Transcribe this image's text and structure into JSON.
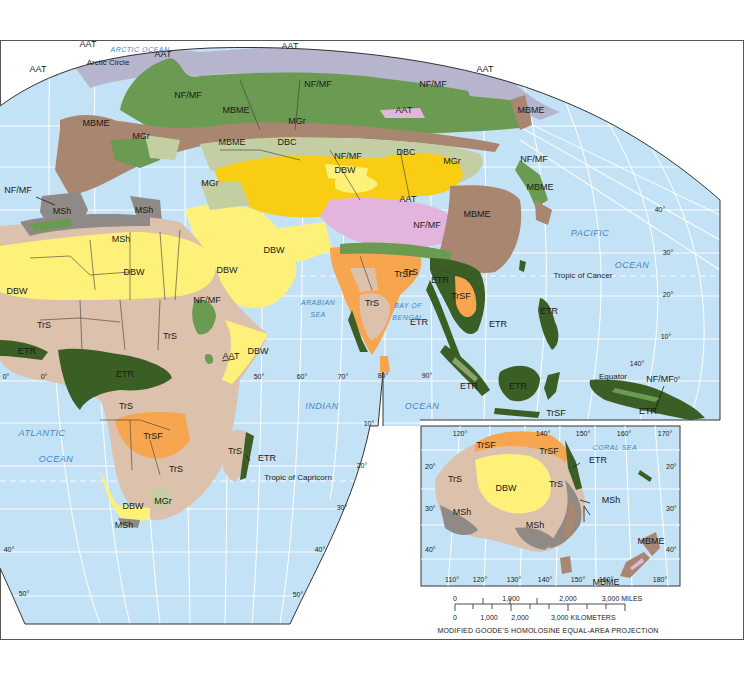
{
  "map": {
    "projection": "MODIFIED GOODE'S HOMOLOSINE EQUAL-AREA PROJECTION",
    "colors": {
      "ocean": "#c4e2f5",
      "land_border": "#3d3d3d",
      "AAT": "#b7b4cd",
      "AAT_highland": "#e3b5dc",
      "NF_MF": "#6b9a52",
      "MBME": "#a88670",
      "MGr": "#c3cfa3",
      "DBC": "#f9cd14",
      "DBW": "#fdf17a",
      "MSh": "#8f8a86",
      "TrS": "#dcc1ad",
      "TrSF": "#f8a54f",
      "ETR": "#3b5e24",
      "graticule": "#ffffff"
    },
    "biome_labels": [
      {
        "code": "AAT",
        "x": 88,
        "y": 47
      },
      {
        "code": "AAT",
        "x": 163,
        "y": 57
      },
      {
        "code": "AAT",
        "x": 38,
        "y": 72
      },
      {
        "code": "AAT",
        "x": 290,
        "y": 49
      },
      {
        "code": "AAT",
        "x": 485,
        "y": 72
      },
      {
        "code": "AAT",
        "x": 404,
        "y": 113
      },
      {
        "code": "AAT",
        "x": 408,
        "y": 202
      },
      {
        "code": "AAT",
        "x": 231,
        "y": 359
      },
      {
        "code": "NF/MF",
        "x": 188,
        "y": 98
      },
      {
        "code": "NF/MF",
        "x": 318,
        "y": 87
      },
      {
        "code": "NF/MF",
        "x": 433,
        "y": 87
      },
      {
        "code": "NF/MF",
        "x": 348,
        "y": 159
      },
      {
        "code": "NF/MF",
        "x": 534,
        "y": 162
      },
      {
        "code": "NF/MF",
        "x": 18,
        "y": 193
      },
      {
        "code": "NF/MF",
        "x": 427,
        "y": 228
      },
      {
        "code": "NF/MF",
        "x": 207,
        "y": 303
      },
      {
        "code": "NF/MF",
        "x": 660,
        "y": 382
      },
      {
        "code": "MBME",
        "x": 236,
        "y": 113
      },
      {
        "code": "MBME",
        "x": 96,
        "y": 126
      },
      {
        "code": "MBME",
        "x": 232,
        "y": 145
      },
      {
        "code": "MBME",
        "x": 531,
        "y": 113
      },
      {
        "code": "MBME",
        "x": 540,
        "y": 190
      },
      {
        "code": "MBME",
        "x": 477,
        "y": 217
      },
      {
        "code": "MBME",
        "x": 606,
        "y": 585
      },
      {
        "code": "MBME",
        "x": 651,
        "y": 544
      },
      {
        "code": "MGr",
        "x": 297,
        "y": 124
      },
      {
        "code": "MGr",
        "x": 141,
        "y": 139
      },
      {
        "code": "MGr",
        "x": 210,
        "y": 186
      },
      {
        "code": "MGr",
        "x": 452,
        "y": 164
      },
      {
        "code": "MGr",
        "x": 163,
        "y": 504
      },
      {
        "code": "DBC",
        "x": 287,
        "y": 145
      },
      {
        "code": "DBC",
        "x": 406,
        "y": 155
      },
      {
        "code": "DBW",
        "x": 345,
        "y": 173
      },
      {
        "code": "DBW",
        "x": 274,
        "y": 253
      },
      {
        "code": "DBW",
        "x": 227,
        "y": 273
      },
      {
        "code": "DBW",
        "x": 134,
        "y": 275
      },
      {
        "code": "DBW",
        "x": 17,
        "y": 294
      },
      {
        "code": "DBW",
        "x": 258,
        "y": 354
      },
      {
        "code": "DBW",
        "x": 133,
        "y": 509
      },
      {
        "code": "DBW",
        "x": 506,
        "y": 491
      },
      {
        "code": "MSh",
        "x": 62,
        "y": 214
      },
      {
        "code": "MSh",
        "x": 144,
        "y": 213
      },
      {
        "code": "MSh",
        "x": 121,
        "y": 242
      },
      {
        "code": "MSh",
        "x": 124,
        "y": 528
      },
      {
        "code": "MSh",
        "x": 462,
        "y": 515
      },
      {
        "code": "MSh",
        "x": 535,
        "y": 528
      },
      {
        "code": "MSh",
        "x": 611,
        "y": 503
      },
      {
        "code": "TrS",
        "x": 44,
        "y": 328
      },
      {
        "code": "TrS",
        "x": 170,
        "y": 339
      },
      {
        "code": "TrS",
        "x": 126,
        "y": 409
      },
      {
        "code": "TrS",
        "x": 176,
        "y": 472
      },
      {
        "code": "TrS",
        "x": 235,
        "y": 454
      },
      {
        "code": "TrS",
        "x": 411,
        "y": 275
      },
      {
        "code": "TrS",
        "x": 372,
        "y": 306
      },
      {
        "code": "TrS",
        "x": 455,
        "y": 482
      },
      {
        "code": "TrS",
        "x": 556,
        "y": 487
      },
      {
        "code": "TrSF",
        "x": 153,
        "y": 439
      },
      {
        "code": "TrSF",
        "x": 404,
        "y": 277
      },
      {
        "code": "TrSF",
        "x": 461,
        "y": 299
      },
      {
        "code": "TrSF",
        "x": 556,
        "y": 416
      },
      {
        "code": "TrSF",
        "x": 486,
        "y": 448
      },
      {
        "code": "TrSF",
        "x": 549,
        "y": 454
      },
      {
        "code": "ETR",
        "x": 27,
        "y": 354
      },
      {
        "code": "ETR",
        "x": 125,
        "y": 377
      },
      {
        "code": "ETR",
        "x": 440,
        "y": 283
      },
      {
        "code": "ETR",
        "x": 419,
        "y": 325
      },
      {
        "code": "ETR",
        "x": 498,
        "y": 327
      },
      {
        "code": "ETR",
        "x": 549,
        "y": 314
      },
      {
        "code": "ETR",
        "x": 469,
        "y": 389
      },
      {
        "code": "ETR",
        "x": 518,
        "y": 389
      },
      {
        "code": "ETR",
        "x": 648,
        "y": 414
      },
      {
        "code": "ETR",
        "x": 267,
        "y": 461
      },
      {
        "code": "ETR",
        "x": 598,
        "y": 463
      }
    ],
    "ocean_labels": [
      {
        "text": "ARCTIC  OCEAN",
        "x": 140,
        "y": 52,
        "size": "sm"
      },
      {
        "text": "PACIFIC",
        "x": 590,
        "y": 236,
        "size": "lg"
      },
      {
        "text": "OCEAN",
        "x": 632,
        "y": 268,
        "size": "lg"
      },
      {
        "text": "ARABIAN",
        "x": 318,
        "y": 305,
        "size": "sm"
      },
      {
        "text": "SEA",
        "x": 318,
        "y": 317,
        "size": "sm"
      },
      {
        "text": "BAY OF",
        "x": 408,
        "y": 308,
        "size": "sm"
      },
      {
        "text": "BENGAL",
        "x": 408,
        "y": 320,
        "size": "sm"
      },
      {
        "text": "INDIAN",
        "x": 322,
        "y": 409,
        "size": "lg"
      },
      {
        "text": "OCEAN",
        "x": 422,
        "y": 409,
        "size": "lg"
      },
      {
        "text": "ATLANTIC",
        "x": 42,
        "y": 436,
        "size": "lg"
      },
      {
        "text": "OCEAN",
        "x": 56,
        "y": 462,
        "size": "lg"
      },
      {
        "text": "CORAL  SEA",
        "x": 615,
        "y": 450,
        "size": "sm"
      }
    ],
    "line_labels": [
      {
        "text": "Arctic Circle",
        "x": 108,
        "y": 65
      },
      {
        "text": "Tropic of Cancer",
        "x": 583,
        "y": 278
      },
      {
        "text": "Equator",
        "x": 613,
        "y": 379
      },
      {
        "text": "Tropic of Capricorn",
        "x": 298,
        "y": 480
      }
    ],
    "degree_labels": [
      {
        "text": "40°",
        "x": 660,
        "y": 212
      },
      {
        "text": "30°",
        "x": 668,
        "y": 255
      },
      {
        "text": "20°",
        "x": 668,
        "y": 297
      },
      {
        "text": "10°",
        "x": 666,
        "y": 339
      },
      {
        "text": "140°",
        "x": 637,
        "y": 366
      },
      {
        "text": "0°",
        "x": 677,
        "y": 382
      },
      {
        "text": "0°",
        "x": 6,
        "y": 379
      },
      {
        "text": "0°",
        "x": 44,
        "y": 379
      },
      {
        "text": "50°",
        "x": 259,
        "y": 379
      },
      {
        "text": "60°",
        "x": 302,
        "y": 379
      },
      {
        "text": "70°",
        "x": 343,
        "y": 379
      },
      {
        "text": "80°",
        "x": 383,
        "y": 378
      },
      {
        "text": "90°",
        "x": 427,
        "y": 378
      },
      {
        "text": "10°",
        "x": 369,
        "y": 426
      },
      {
        "text": "20°",
        "x": 362,
        "y": 468
      },
      {
        "text": "30°",
        "x": 342,
        "y": 510
      },
      {
        "text": "40°",
        "x": 320,
        "y": 552
      },
      {
        "text": "50°",
        "x": 298,
        "y": 597
      },
      {
        "text": "40°",
        "x": 9,
        "y": 552
      },
      {
        "text": "50°",
        "x": 24,
        "y": 596
      }
    ],
    "inset": {
      "name": "Australia and New Zealand",
      "top_degrees": [
        "120°",
        "140°",
        "150°",
        "160°",
        "170°"
      ],
      "bottom_degrees": [
        "110°",
        "120°",
        "130°",
        "140°",
        "150°",
        "160°",
        "180°"
      ],
      "left_degrees": [
        "20°",
        "30°",
        "40°"
      ],
      "right_degrees": [
        "20°",
        "30°",
        "40°"
      ]
    },
    "scale": {
      "miles_ticks": [
        "0",
        "1,000",
        "2,000",
        "3,000 MILES"
      ],
      "km_ticks": [
        "0",
        "1,000",
        "2,000",
        "3,000 KILOMETERS"
      ]
    }
  }
}
